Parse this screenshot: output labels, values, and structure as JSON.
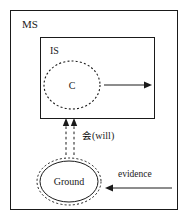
{
  "diagram": {
    "type": "nested-box-flow-diagram",
    "outer_box": {
      "label": "MS",
      "name": "outer-box-ms"
    },
    "inner_box": {
      "label": "IS",
      "name": "inner-box-is"
    },
    "concept_node": {
      "label": "C",
      "shape": "dashed-ellipse"
    },
    "ground_node": {
      "label": "Ground",
      "shape": "double-ellipse-solid-inner-dashed-outer"
    },
    "connectors": [
      {
        "name": "inner-right-arrow",
        "label": "",
        "style": "solid",
        "direction": "right"
      },
      {
        "name": "will-arrow",
        "label": "会(will)",
        "label_cjk": "会",
        "label_latin": "(will)",
        "style": "dashed-double",
        "direction": "up"
      },
      {
        "name": "evidence-arrow",
        "label": "evidence",
        "style": "solid",
        "direction": "left"
      }
    ],
    "colors": {
      "stroke": "#1a1a1a",
      "background": "#ffffff",
      "text": "#1a1a1a"
    }
  }
}
